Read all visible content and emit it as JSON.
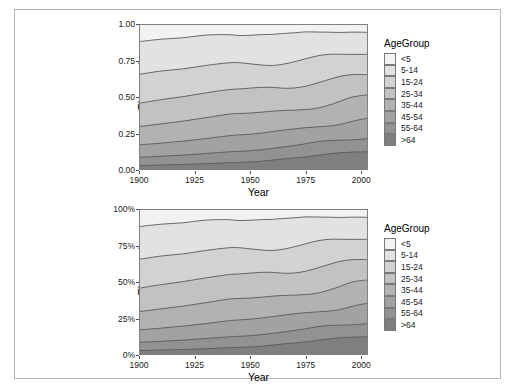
{
  "figure": {
    "background": "#ffffff",
    "border_color": "#b4b4b4",
    "panel_background": "#e8e8e8",
    "gridline_color": "#ffffff",
    "line_color": "#595959"
  },
  "legend": {
    "title": "AgeGroup",
    "items": [
      {
        "label": "<5",
        "color": "#f2f2f2"
      },
      {
        "label": "5-14",
        "color": "#e2e2e2"
      },
      {
        "label": "15-24",
        "color": "#d2d2d2"
      },
      {
        "label": "25-34",
        "color": "#c2c2c2"
      },
      {
        "label": "35-44",
        "color": "#b2b2b2"
      },
      {
        "label": "45-54",
        "color": "#a2a2a2"
      },
      {
        "label": "55-64",
        "color": "#929292"
      },
      {
        "label": ">64",
        "color": "#7f7f7f"
      }
    ]
  },
  "chart_data": [
    {
      "type": "area",
      "id": "top",
      "stacked": true,
      "title": "",
      "xlabel": "Year",
      "ylabel": "Thousands",
      "xlim": [
        1900,
        2003
      ],
      "ylim": [
        0.0,
        1.0
      ],
      "xticks": [
        1900,
        1925,
        1950,
        1975,
        2000
      ],
      "xticklabels": [
        "1900",
        "1925",
        "1950",
        "1975",
        "2000"
      ],
      "yticks": [
        0.0,
        0.25,
        0.5,
        0.75,
        1.0
      ],
      "yticklabels": [
        "0.00",
        "0.25",
        "0.50",
        "0.75",
        "1.00"
      ],
      "grid": true,
      "legend_position": "right",
      "legend_title": "AgeGroup",
      "x": [
        1900,
        1910,
        1920,
        1930,
        1940,
        1945,
        1950,
        1955,
        1960,
        1965,
        1970,
        1975,
        1980,
        1985,
        1990,
        1995,
        2000,
        2003
      ],
      "series": [
        {
          "name": ">64",
          "values": [
            0.03,
            0.034,
            0.038,
            0.043,
            0.05,
            0.052,
            0.055,
            0.06,
            0.068,
            0.076,
            0.082,
            0.09,
            0.1,
            0.11,
            0.118,
            0.122,
            0.124,
            0.125
          ]
        },
        {
          "name": "55-64",
          "values": [
            0.057,
            0.06,
            0.064,
            0.07,
            0.074,
            0.076,
            0.077,
            0.079,
            0.08,
            0.082,
            0.086,
            0.09,
            0.093,
            0.092,
            0.086,
            0.084,
            0.087,
            0.09
          ]
        },
        {
          "name": "45-54",
          "values": [
            0.085,
            0.09,
            0.096,
            0.102,
            0.11,
            0.112,
            0.113,
            0.114,
            0.115,
            0.115,
            0.114,
            0.11,
            0.102,
            0.098,
            0.106,
            0.124,
            0.136,
            0.14
          ]
        },
        {
          "name": "35-44",
          "values": [
            0.125,
            0.132,
            0.137,
            0.143,
            0.148,
            0.147,
            0.145,
            0.143,
            0.14,
            0.135,
            0.128,
            0.124,
            0.128,
            0.142,
            0.158,
            0.166,
            0.163,
            0.158
          ]
        },
        {
          "name": "25-34",
          "values": [
            0.16,
            0.166,
            0.168,
            0.17,
            0.168,
            0.168,
            0.171,
            0.17,
            0.163,
            0.152,
            0.152,
            0.16,
            0.172,
            0.176,
            0.172,
            0.156,
            0.144,
            0.14
          ]
        },
        {
          "name": "15-24",
          "values": [
            0.198,
            0.196,
            0.19,
            0.188,
            0.184,
            0.18,
            0.166,
            0.153,
            0.15,
            0.165,
            0.18,
            0.188,
            0.186,
            0.174,
            0.153,
            0.14,
            0.138,
            0.139
          ]
        },
        {
          "name": "5-14",
          "values": [
            0.224,
            0.218,
            0.213,
            0.208,
            0.193,
            0.186,
            0.196,
            0.208,
            0.213,
            0.21,
            0.198,
            0.184,
            0.164,
            0.152,
            0.149,
            0.152,
            0.152,
            0.15
          ]
        },
        {
          "name": "<5",
          "values": [
            0.121,
            0.114,
            0.114,
            0.106,
            0.093,
            0.099,
            0.117,
            0.123,
            0.121,
            0.105,
            0.09,
            0.074,
            0.075,
            0.076,
            0.078,
            0.076,
            0.076,
            0.078
          ]
        }
      ]
    },
    {
      "type": "area",
      "id": "bottom",
      "stacked": true,
      "normalized": true,
      "title": "",
      "xlabel": "Year",
      "ylabel": "Thousands",
      "xlim": [
        1900,
        2003
      ],
      "ylim": [
        0,
        100
      ],
      "xticks": [
        1900,
        1925,
        1950,
        1975,
        2000
      ],
      "xticklabels": [
        "1900",
        "1925",
        "1950",
        "1975",
        "2000"
      ],
      "yticks": [
        0,
        25,
        50,
        75,
        100
      ],
      "yticklabels": [
        "0%",
        "25%",
        "50%",
        "75%",
        "100%"
      ],
      "grid": true,
      "legend_position": "right",
      "legend_title": "AgeGroup",
      "x": [
        1900,
        1910,
        1920,
        1930,
        1940,
        1945,
        1950,
        1955,
        1960,
        1965,
        1970,
        1975,
        1980,
        1985,
        1990,
        1995,
        2000,
        2003
      ],
      "series": [
        {
          "name": ">64",
          "values": [
            3.0,
            3.4,
            3.8,
            4.3,
            5.0,
            5.2,
            5.5,
            6.0,
            6.8,
            7.6,
            8.2,
            9.0,
            10.0,
            11.0,
            11.8,
            12.2,
            12.4,
            12.5
          ]
        },
        {
          "name": "55-64",
          "values": [
            5.7,
            6.0,
            6.4,
            7.0,
            7.4,
            7.6,
            7.7,
            7.9,
            8.0,
            8.2,
            8.6,
            9.0,
            9.3,
            9.2,
            8.6,
            8.4,
            8.7,
            9.0
          ]
        },
        {
          "name": "45-54",
          "values": [
            8.5,
            9.0,
            9.6,
            10.2,
            11.0,
            11.2,
            11.3,
            11.4,
            11.5,
            11.5,
            11.4,
            11.0,
            10.2,
            9.8,
            10.6,
            12.4,
            13.6,
            14.0
          ]
        },
        {
          "name": "35-44",
          "values": [
            12.5,
            13.2,
            13.7,
            14.3,
            14.8,
            14.7,
            14.5,
            14.3,
            14.0,
            13.5,
            12.8,
            12.4,
            12.8,
            14.2,
            15.8,
            16.6,
            16.3,
            15.8
          ]
        },
        {
          "name": "25-34",
          "values": [
            16.0,
            16.6,
            16.8,
            17.0,
            16.8,
            16.8,
            17.1,
            17.0,
            16.3,
            15.2,
            15.2,
            16.0,
            17.2,
            17.6,
            17.2,
            15.6,
            14.4,
            14.0
          ]
        },
        {
          "name": "15-24",
          "values": [
            19.8,
            19.6,
            19.0,
            18.8,
            18.4,
            18.0,
            16.6,
            15.3,
            15.0,
            16.5,
            18.0,
            18.8,
            18.6,
            17.4,
            15.3,
            14.0,
            13.8,
            13.9
          ]
        },
        {
          "name": "5-14",
          "values": [
            22.4,
            21.8,
            21.3,
            20.8,
            19.3,
            18.6,
            19.6,
            20.8,
            21.3,
            21.0,
            19.8,
            18.4,
            16.4,
            15.2,
            14.9,
            15.2,
            15.2,
            15.0
          ]
        },
        {
          "name": "<5",
          "values": [
            12.1,
            11.4,
            11.4,
            10.6,
            9.3,
            9.9,
            11.7,
            12.3,
            12.1,
            10.5,
            9.0,
            7.4,
            7.5,
            7.6,
            7.8,
            7.6,
            7.6,
            7.8
          ]
        }
      ]
    }
  ]
}
